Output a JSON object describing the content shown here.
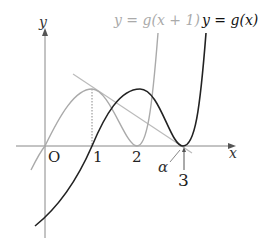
{
  "diagram": {
    "type": "function-graph",
    "axes": {
      "x_label": "x",
      "y_label": "y",
      "origin_label": "O"
    },
    "x_ticks": [
      "1",
      "2",
      "3"
    ],
    "alpha_label": "α",
    "curves": [
      {
        "name": "g(x+1)",
        "label": "y = g(x + 1)",
        "color": "#aaaaaa"
      },
      {
        "name": "g(x)",
        "label": "y = g(x)",
        "color": "#222222"
      }
    ],
    "tangent_line": {
      "color": "#bbbbbb"
    },
    "colors": {
      "axis": "#888888",
      "gray_curve": "#aaaaaa",
      "black_curve": "#222222"
    }
  }
}
